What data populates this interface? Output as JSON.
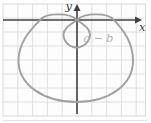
{
  "figure": {
    "annotation_label": "a − b",
    "x_axis_label": "x",
    "y_axis_label": "y"
  },
  "chart_data": {
    "type": "line",
    "title": "",
    "xlabel": "x",
    "ylabel": "y",
    "legend": "none",
    "grid": "on",
    "curve": {
      "name": "limacon-with-inner-loop",
      "polar_form": "r = a − b sin θ, b > a",
      "annotation": {
        "text": "a − b",
        "meaning": "distance from pole to tip of inner loop",
        "position_px": {
          "x": 98.5,
          "y": 42
        }
      },
      "origin_px": {
        "x": 77,
        "y": 20
      },
      "features_px": {
        "x_axis_crossings_x": [
          40,
          114
        ],
        "wing_peaks": [
          {
            "x": 58,
            "y": 14
          },
          {
            "x": 96,
            "y": 14
          }
        ],
        "inner_loop": {
          "left_x": 63.5,
          "right_x": 90,
          "bottom_y": 47.5,
          "center": {
            "x": 76.5,
            "y": 34.5
          }
        },
        "outer_loop": {
          "leftmost": {
            "x": 18.5,
            "y": 60
          },
          "rightmost": {
            "x": 133,
            "y": 61
          },
          "bottom": {
            "x": 76.5,
            "y": 102
          }
        }
      },
      "path_segments": [
        "M114,20",
        "C108,12.5 84,12.5 77,20",
        "C70,25 63.5,28.5 63.5,34.5",
        "C63.5,41.5 69.5,47.5 76.5,47.5",
        "C83.5,47.5 90,41.5 90,34.5",
        "C90,28.5 84,25 77,20",
        "C70,12.5 46,12.5 40,20",
        "C33,28 19,40 18.5,60",
        "C18,85 44,102 76.5,102",
        "C109,102 133,85 133,61",
        "C133,40 121,28 114,20",
        "Z"
      ]
    },
    "axes_geometry": {
      "x_axis": {
        "x1": 3,
        "y1": 20,
        "x2": 136,
        "y2": 20,
        "arrow_points": "135,16.5 142,20 135,23.5",
        "label_pos": {
          "x": 139,
          "y": 31
        }
      },
      "y_axis": {
        "x1": 77,
        "y1": 10,
        "x2": 77,
        "y2": 114,
        "arrow_points": "73.5,11 77,4 80.5,11",
        "label_pos": {
          "x": 72,
          "y": 10
        }
      }
    },
    "grid_geometry": {
      "x0": 3,
      "y0": 4,
      "x1": 145.5,
      "y1": 116,
      "dx": 14.8,
      "dy": 14
    },
    "shadow_line": {
      "x1": 3,
      "y1": 120.5,
      "x2": 148,
      "y2": 120.5
    },
    "colors": {
      "background": "#fdfdfd",
      "grid_line": "#dcdcdc",
      "grid_border": "#d9d9d9",
      "axis": "#404040",
      "curve": "#a0a0a0",
      "annotation_text": "#b0b0b0",
      "axis_label_text": "#3a3a3a",
      "shadow": "#e6e6e6"
    }
  }
}
